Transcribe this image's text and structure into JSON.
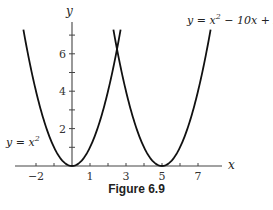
{
  "caption": "Figure 6.9",
  "chart_data": {
    "type": "line",
    "title": "",
    "xlabel": "x",
    "ylabel": "y",
    "xlim": [
      -3,
      8
    ],
    "ylim": [
      0,
      7.5
    ],
    "grid": false,
    "x_ticks": [
      -2,
      -1,
      1,
      2,
      3,
      4,
      5,
      6,
      7
    ],
    "x_tick_labels": [
      "-2",
      "1",
      "3",
      "5",
      "7"
    ],
    "y_ticks": [
      1,
      2,
      3,
      4,
      5,
      6,
      7
    ],
    "y_tick_labels": [
      "2",
      "4",
      "6"
    ],
    "series": [
      {
        "name": "y = x^2",
        "formula": "x^2",
        "x_range": [
          -2.7,
          2.7
        ],
        "vertex": [
          0,
          0
        ]
      },
      {
        "name": "y = x^2 - 10x + 25",
        "formula": "(x-5)^2",
        "x_range": [
          2.3,
          7.7
        ],
        "vertex": [
          5,
          0
        ]
      }
    ],
    "annotations": [
      {
        "text": "y = x²",
        "position": "left of first parabola, near y=1.5"
      },
      {
        "text": "y = x² − 10x + 25",
        "position": "top right"
      }
    ],
    "intersection": [
      2.5,
      6.25
    ]
  },
  "labels": {
    "x_axis": "x",
    "y_axis": "y",
    "curve1": "y = x",
    "curve1_exp": "2",
    "curve2_a": "y = x",
    "curve2_exp": "2",
    "curve2_b": " − 10x + 25",
    "tick_x": [
      "−2",
      "1",
      "3",
      "5",
      "7"
    ],
    "tick_y": [
      "2",
      "4",
      "6"
    ]
  }
}
